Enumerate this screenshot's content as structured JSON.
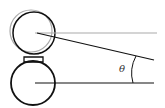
{
  "diagram": {
    "angle_label": "θ",
    "colors": {
      "stroke": "#111111",
      "ghost": "#aaaaaa",
      "connector_fill": "#ffffff"
    }
  }
}
